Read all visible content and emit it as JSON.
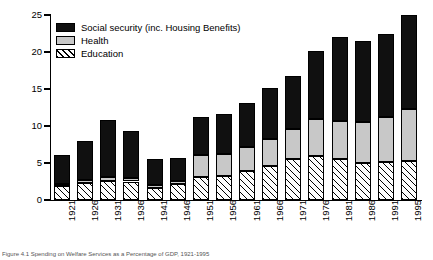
{
  "chart_data": {
    "type": "bar",
    "stacked": true,
    "title": "",
    "xlabel": "",
    "ylabel": "Percentage of GDP",
    "ylim": [
      0,
      25
    ],
    "yticks": [
      0,
      5,
      10,
      15,
      20,
      25
    ],
    "grid": false,
    "legend_position": "top-left",
    "categories": [
      "1921",
      "1926",
      "1931",
      "1936",
      "1941",
      "1946",
      "1951",
      "1956",
      "1961",
      "1966",
      "1971",
      "1976",
      "1981",
      "1986",
      "1991",
      "1995"
    ],
    "series": [
      {
        "name": "Education",
        "order": "bottom",
        "pattern": "diagonal-hatch",
        "color": "#ffffff",
        "values": [
          1.9,
          2.3,
          2.6,
          2.5,
          1.6,
          2.1,
          3.1,
          3.2,
          3.9,
          4.6,
          5.6,
          6.0,
          5.6,
          5.0,
          5.2,
          5.3
        ]
      },
      {
        "name": "Health",
        "order": "middle",
        "pattern": "solid",
        "color": "#c8c8c8",
        "values": [
          0.3,
          0.4,
          0.5,
          0.5,
          0.4,
          0.5,
          3.0,
          3.0,
          3.3,
          3.6,
          4.0,
          5.0,
          5.1,
          5.5,
          6.0,
          7.0
        ]
      },
      {
        "name": "Social security (inc. Housing Benefits)",
        "order": "top",
        "pattern": "solid",
        "color": "#101010",
        "values": [
          3.9,
          5.3,
          7.7,
          6.3,
          3.5,
          3.1,
          5.1,
          5.4,
          5.9,
          6.9,
          7.2,
          9.1,
          11.3,
          11.0,
          11.2,
          12.7
        ]
      }
    ],
    "totals": [
      6.1,
      8.0,
      10.8,
      9.3,
      5.5,
      5.7,
      11.2,
      11.6,
      13.1,
      15.1,
      16.8,
      20.1,
      22.0,
      21.5,
      22.4,
      25.0
    ]
  },
  "legend": {
    "items": [
      {
        "label": "Social security (inc. Housing Benefits)",
        "swatch": "social"
      },
      {
        "label": "Health",
        "swatch": "health"
      },
      {
        "label": "Education",
        "swatch": "education"
      }
    ]
  },
  "caption": {
    "text": "Figure 4.1  Spending on Welfare Services as a Percentage of GDP, 1921-1995"
  }
}
